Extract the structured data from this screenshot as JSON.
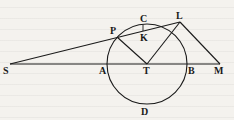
{
  "figure": {
    "type": "geometric-diagram",
    "circle": {
      "center": "T",
      "cx": 147,
      "cy": 64,
      "r": 40
    },
    "points": {
      "S": {
        "x": 10,
        "y": 64,
        "label": "S"
      },
      "A": {
        "x": 107,
        "y": 64,
        "label": "A"
      },
      "T": {
        "x": 147,
        "y": 64,
        "label": "T"
      },
      "B": {
        "x": 187,
        "y": 64,
        "label": "B"
      },
      "M": {
        "x": 220,
        "y": 64,
        "label": "M"
      },
      "P": {
        "x": 117,
        "y": 37,
        "label": "P"
      },
      "C": {
        "x": 143,
        "y": 24,
        "label": "C"
      },
      "K": {
        "x": 143,
        "y": 31,
        "label": "K"
      },
      "L": {
        "x": 180,
        "y": 22,
        "label": "L"
      },
      "D": {
        "x": 145,
        "y": 104,
        "label": "D"
      }
    },
    "segments": [
      "S-M",
      "S-L",
      "P-T",
      "T-L",
      "L-M",
      "C-K"
    ]
  }
}
